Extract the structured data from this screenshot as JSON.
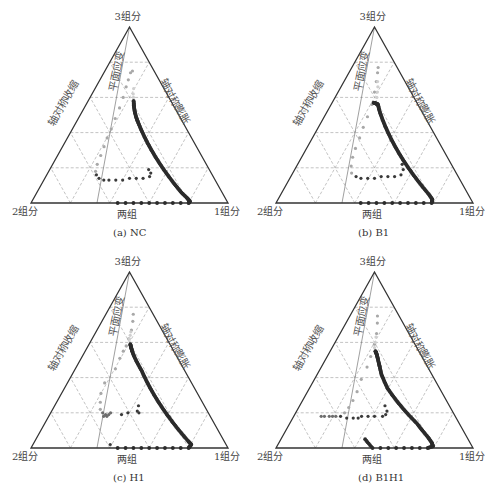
{
  "figure": {
    "vertex_labels": {
      "top": "3组分",
      "left": "2组分",
      "right": "1组分",
      "bottom_mid": "两组"
    },
    "region_labels": {
      "contraction": "轴对称收缩",
      "expansion": "轴对称膨胀",
      "plane_strain": "平面应变"
    },
    "colors": {
      "axis": "#333333",
      "grid": "#9a9a9a",
      "plane_line": "#777777",
      "dark": "#2b2b2b",
      "mid": "#6e6e6e",
      "light": "#b5b5b5",
      "lighter": "#d2d2d2"
    }
  },
  "panels": [
    {
      "id": "a",
      "caption": "(a) NC"
    },
    {
      "id": "b",
      "caption": "(b) B1"
    },
    {
      "id": "c",
      "caption": "(c) H1"
    },
    {
      "id": "d",
      "caption": "(d) B1H1"
    }
  ],
  "chart_data": [
    {
      "type": "scatter",
      "subtype": "ternary",
      "title": "(a) NC",
      "vertices": [
        "3组分",
        "2组分",
        "1组分"
      ],
      "grid_divisions": 5,
      "annotations": [
        "轴对称收缩",
        "轴对称膨胀",
        "平面应变",
        "两组"
      ],
      "series": [
        {
          "name": "main-dark",
          "color": "#2b2b2b",
          "points_uv": [
            [
              0.55,
              0.58
            ],
            [
              0.55,
              0.55
            ],
            [
              0.555,
              0.52
            ],
            [
              0.565,
              0.49
            ],
            [
              0.58,
              0.46
            ],
            [
              0.6,
              0.42
            ],
            [
              0.62,
              0.38
            ],
            [
              0.64,
              0.34
            ],
            [
              0.66,
              0.3
            ],
            [
              0.68,
              0.26
            ],
            [
              0.7,
              0.22
            ],
            [
              0.72,
              0.18
            ],
            [
              0.74,
              0.14
            ],
            [
              0.76,
              0.1
            ],
            [
              0.78,
              0.06
            ],
            [
              0.8,
              0.03
            ],
            [
              0.81,
              0.01
            ],
            [
              0.8,
              0.0
            ],
            [
              0.76,
              0.0
            ],
            [
              0.72,
              0.0
            ],
            [
              0.68,
              0.0
            ],
            [
              0.64,
              0.0
            ],
            [
              0.6,
              0.0
            ],
            [
              0.56,
              0.0
            ],
            [
              0.52,
              0.0
            ],
            [
              0.48,
              0.0
            ],
            [
              0.44,
              0.0
            ]
          ]
        },
        {
          "name": "secondary-dark",
          "color": "#3a3a3a",
          "points_uv": [
            [
              0.62,
              0.19
            ],
            [
              0.63,
              0.17
            ],
            [
              0.62,
              0.15
            ],
            [
              0.58,
              0.14
            ],
            [
              0.54,
              0.14
            ],
            [
              0.5,
              0.14
            ],
            [
              0.46,
              0.13
            ],
            [
              0.42,
              0.13
            ],
            [
              0.38,
              0.13
            ],
            [
              0.35,
              0.13
            ],
            [
              0.32,
              0.14
            ],
            [
              0.3,
              0.16
            ]
          ]
        },
        {
          "name": "secondary-light",
          "color": "#a8a8a8",
          "points_uv": [
            [
              0.29,
              0.18
            ],
            [
              0.29,
              0.22
            ],
            [
              0.3,
              0.27
            ],
            [
              0.31,
              0.32
            ],
            [
              0.32,
              0.37
            ],
            [
              0.34,
              0.42
            ],
            [
              0.36,
              0.48
            ],
            [
              0.39,
              0.54
            ],
            [
              0.42,
              0.6
            ],
            [
              0.45,
              0.66
            ],
            [
              0.48,
              0.7
            ],
            [
              0.52,
              0.74
            ],
            [
              0.56,
              0.75
            ]
          ]
        },
        {
          "name": "transition-light",
          "color": "#cfcfcf",
          "points_uv": [
            [
              0.55,
              0.6
            ],
            [
              0.55,
              0.62
            ],
            [
              0.56,
              0.65
            ]
          ]
        }
      ]
    },
    {
      "type": "scatter",
      "subtype": "ternary",
      "title": "(b) B1",
      "vertices": [
        "3组分",
        "2组分",
        "1组分"
      ],
      "grid_divisions": 5,
      "annotations": [
        "轴对称收缩",
        "轴对称膨胀",
        "平面应变",
        "两组"
      ],
      "series": [
        {
          "name": "main-dark",
          "color": "#2b2b2b",
          "points_uv": [
            [
              0.49,
              0.57
            ],
            [
              0.52,
              0.565
            ],
            [
              0.54,
              0.56
            ],
            [
              0.55,
              0.53
            ],
            [
              0.57,
              0.49
            ],
            [
              0.59,
              0.45
            ],
            [
              0.61,
              0.41
            ],
            [
              0.63,
              0.37
            ],
            [
              0.65,
              0.33
            ],
            [
              0.67,
              0.29
            ],
            [
              0.69,
              0.25
            ],
            [
              0.71,
              0.21
            ],
            [
              0.73,
              0.17
            ],
            [
              0.75,
              0.13
            ],
            [
              0.77,
              0.09
            ],
            [
              0.79,
              0.05
            ],
            [
              0.8,
              0.02
            ],
            [
              0.79,
              0.0
            ],
            [
              0.75,
              0.0
            ],
            [
              0.71,
              0.0
            ],
            [
              0.67,
              0.0
            ],
            [
              0.63,
              0.0
            ],
            [
              0.59,
              0.0
            ],
            [
              0.55,
              0.0
            ],
            [
              0.51,
              0.0
            ],
            [
              0.47,
              0.0
            ],
            [
              0.43,
              0.0
            ]
          ]
        },
        {
          "name": "secondary-dark",
          "color": "#3a3a3a",
          "points_uv": [
            [
              0.68,
              0.22
            ],
            [
              0.68,
              0.19
            ],
            [
              0.66,
              0.16
            ],
            [
              0.62,
              0.15
            ],
            [
              0.58,
              0.15
            ],
            [
              0.54,
              0.15
            ],
            [
              0.5,
              0.14
            ],
            [
              0.46,
              0.14
            ],
            [
              0.42,
              0.14
            ],
            [
              0.39,
              0.15
            ]
          ]
        },
        {
          "name": "secondary-light",
          "color": "#a8a8a8",
          "points_uv": [
            [
              0.36,
              0.17
            ],
            [
              0.35,
              0.21
            ],
            [
              0.35,
              0.26
            ],
            [
              0.36,
              0.31
            ],
            [
              0.38,
              0.37
            ],
            [
              0.4,
              0.43
            ],
            [
              0.43,
              0.49
            ],
            [
              0.47,
              0.56
            ],
            [
              0.5,
              0.63
            ],
            [
              0.53,
              0.69
            ],
            [
              0.56,
              0.74
            ],
            [
              0.58,
              0.77
            ]
          ]
        },
        {
          "name": "transition-light",
          "color": "#cfcfcf",
          "points_uv": [
            [
              0.53,
              0.6
            ],
            [
              0.54,
              0.63
            ],
            [
              0.55,
              0.66
            ],
            [
              0.55,
              0.69
            ]
          ]
        }
      ]
    },
    {
      "type": "scatter",
      "subtype": "ternary",
      "title": "(c) H1",
      "vertices": [
        "3组分",
        "2组分",
        "1组分"
      ],
      "grid_divisions": 5,
      "annotations": [
        "轴对称收缩",
        "轴对称膨胀",
        "平面应变",
        "两组"
      ],
      "series": [
        {
          "name": "main-dark",
          "color": "#2b2b2b",
          "points_uv": [
            [
              0.51,
              0.59
            ],
            [
              0.52,
              0.57
            ],
            [
              0.53,
              0.55
            ],
            [
              0.55,
              0.52
            ],
            [
              0.58,
              0.48
            ],
            [
              0.61,
              0.44
            ],
            [
              0.63,
              0.4
            ],
            [
              0.65,
              0.36
            ],
            [
              0.67,
              0.32
            ],
            [
              0.69,
              0.28
            ],
            [
              0.71,
              0.24
            ],
            [
              0.73,
              0.2
            ],
            [
              0.75,
              0.16
            ],
            [
              0.77,
              0.12
            ],
            [
              0.79,
              0.08
            ],
            [
              0.81,
              0.04
            ],
            [
              0.82,
              0.02
            ],
            [
              0.8,
              0.0
            ],
            [
              0.76,
              0.0
            ],
            [
              0.72,
              0.0
            ],
            [
              0.68,
              0.0
            ],
            [
              0.64,
              0.0
            ],
            [
              0.6,
              0.0
            ],
            [
              0.56,
              0.0
            ],
            [
              0.52,
              0.0
            ],
            [
              0.48,
              0.0
            ],
            [
              0.44,
              0.0
            ]
          ]
        },
        {
          "name": "secondary-dark",
          "color": "#3a3a3a",
          "points_uv": [
            [
              0.56,
              0.24
            ],
            [
              0.55,
              0.21
            ],
            [
              0.56,
              0.2
            ],
            [
              0.49,
              0.2
            ],
            [
              0.45,
              0.19
            ],
            [
              0.4,
              0.02
            ]
          ]
        },
        {
          "name": "cluster-mid",
          "color": "#6e6e6e",
          "points_uv": [
            [
              0.33,
              0.2
            ],
            [
              0.35,
              0.19
            ],
            [
              0.37,
              0.19
            ],
            [
              0.38,
              0.2
            ],
            [
              0.36,
              0.18
            ],
            [
              0.34,
              0.18
            ]
          ]
        },
        {
          "name": "secondary-light",
          "color": "#a8a8a8",
          "points_uv": [
            [
              0.31,
              0.22
            ],
            [
              0.3,
              0.26
            ],
            [
              0.29,
              0.31
            ],
            [
              0.3,
              0.37
            ],
            [
              0.37,
              0.45
            ],
            [
              0.4,
              0.51
            ],
            [
              0.43,
              0.55
            ],
            [
              0.46,
              0.58
            ],
            [
              0.49,
              0.62
            ],
            [
              0.53,
              0.67
            ],
            [
              0.56,
              0.72
            ],
            [
              0.58,
              0.76
            ]
          ]
        },
        {
          "name": "transition-light",
          "color": "#cfcfcf",
          "points_uv": [
            [
              0.5,
              0.62
            ],
            [
              0.51,
              0.64
            ],
            [
              0.52,
              0.66
            ]
          ]
        }
      ]
    },
    {
      "type": "scatter",
      "subtype": "ternary",
      "title": "(d) B1H1",
      "vertices": [
        "3组分",
        "2组分",
        "1组分"
      ],
      "grid_divisions": 5,
      "annotations": [
        "轴对称收缩",
        "轴对称膨胀",
        "平面应变",
        "两组"
      ],
      "series": [
        {
          "name": "main-dark",
          "color": "#2b2b2b",
          "points_uv": [
            [
              0.51,
              0.55
            ],
            [
              0.52,
              0.54
            ],
            [
              0.53,
              0.52
            ],
            [
              0.54,
              0.49
            ],
            [
              0.55,
              0.46
            ],
            [
              0.56,
              0.42
            ],
            [
              0.58,
              0.38
            ],
            [
              0.6,
              0.34
            ],
            [
              0.63,
              0.3
            ],
            [
              0.66,
              0.26
            ],
            [
              0.69,
              0.22
            ],
            [
              0.72,
              0.18
            ],
            [
              0.75,
              0.14
            ],
            [
              0.77,
              0.1
            ],
            [
              0.79,
              0.06
            ],
            [
              0.8,
              0.03
            ],
            [
              0.8,
              0.01
            ],
            [
              0.77,
              0.0
            ],
            [
              0.73,
              0.0
            ],
            [
              0.69,
              0.0
            ],
            [
              0.65,
              0.0
            ],
            [
              0.61,
              0.0
            ],
            [
              0.57,
              0.0
            ],
            [
              0.53,
              0.0
            ],
            [
              0.49,
              0.0
            ],
            [
              0.45,
              0.05
            ]
          ]
        },
        {
          "name": "secondary-dark",
          "color": "#3a3a3a",
          "points_uv": [
            [
              0.57,
              0.24
            ],
            [
              0.58,
              0.21
            ],
            [
              0.57,
              0.19
            ],
            [
              0.55,
              0.18
            ],
            [
              0.5,
              0.18
            ],
            [
              0.46,
              0.18
            ],
            [
              0.42,
              0.18
            ],
            [
              0.4,
              0.17
            ],
            [
              0.37,
              0.17
            ],
            [
              0.33,
              0.17
            ],
            [
              0.29,
              0.18
            ]
          ]
        },
        {
          "name": "cluster-mid",
          "color": "#6e6e6e",
          "points_uv": [
            [
              0.26,
              0.18
            ],
            [
              0.24,
              0.18
            ],
            [
              0.22,
              0.18
            ],
            [
              0.19,
              0.18
            ],
            [
              0.17,
              0.18
            ]
          ]
        },
        {
          "name": "secondary-light",
          "color": "#a8a8a8",
          "points_uv": [
            [
              0.31,
              0.2
            ],
            [
              0.33,
              0.23
            ],
            [
              0.35,
              0.27
            ],
            [
              0.37,
              0.32
            ],
            [
              0.39,
              0.39
            ],
            [
              0.43,
              0.46
            ],
            [
              0.46,
              0.52
            ],
            [
              0.5,
              0.59
            ],
            [
              0.53,
              0.65
            ],
            [
              0.55,
              0.71
            ],
            [
              0.56,
              0.75
            ]
          ]
        },
        {
          "name": "transition-light",
          "color": "#cfcfcf",
          "points_uv": [
            [
              0.5,
              0.57
            ],
            [
              0.51,
              0.6
            ],
            [
              0.52,
              0.63
            ]
          ]
        }
      ]
    }
  ]
}
